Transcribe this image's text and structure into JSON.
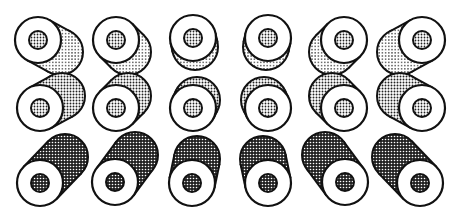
{
  "figure": {
    "width": 464,
    "height": 220,
    "stroke_color": "#111111",
    "fill_face": "#ffffff",
    "fill_hub": "dots-fine",
    "rows": [
      {
        "name": "row-top",
        "shading": "sparse-dots",
        "cells": [
          {
            "cx": 38,
            "cy": 40,
            "dx": 22,
            "dy": 12
          },
          {
            "cx": 116,
            "cy": 40,
            "dx": 12,
            "dy": 12
          },
          {
            "cx": 193,
            "cy": 38,
            "dx": 2,
            "dy": 9
          },
          {
            "cx": 268,
            "cy": 38,
            "dx": -2,
            "dy": 9
          },
          {
            "cx": 344,
            "cy": 40,
            "dx": -12,
            "dy": 12
          },
          {
            "cx": 422,
            "cy": 40,
            "dx": -22,
            "dy": 12
          }
        ]
      },
      {
        "name": "row-middle",
        "shading": "medium-dots",
        "cells": [
          {
            "cx": 40,
            "cy": 108,
            "dx": 22,
            "dy": -12
          },
          {
            "cx": 116,
            "cy": 108,
            "dx": 12,
            "dy": -12
          },
          {
            "cx": 193,
            "cy": 108,
            "dx": 4,
            "dy": -8
          },
          {
            "cx": 268,
            "cy": 108,
            "dx": -4,
            "dy": -8
          },
          {
            "cx": 344,
            "cy": 108,
            "dx": -12,
            "dy": -12
          },
          {
            "cx": 422,
            "cy": 108,
            "dx": -22,
            "dy": -12
          }
        ]
      },
      {
        "name": "row-bottom",
        "shading": "dense-checker",
        "cells": [
          {
            "cx": 40,
            "cy": 183,
            "dx": 25,
            "dy": -26
          },
          {
            "cx": 115,
            "cy": 182,
            "dx": 20,
            "dy": -27
          },
          {
            "cx": 192,
            "cy": 183,
            "dx": 5,
            "dy": -24
          },
          {
            "cx": 268,
            "cy": 183,
            "dx": -5,
            "dy": -24
          },
          {
            "cx": 345,
            "cy": 182,
            "dx": -20,
            "dy": -27
          },
          {
            "cx": 420,
            "cy": 183,
            "dx": -25,
            "dy": -26
          }
        ]
      }
    ],
    "outer_radius": 23,
    "hub_radius": 9
  }
}
